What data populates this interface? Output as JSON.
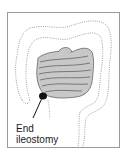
{
  "diagram": {
    "label_line1": "End",
    "label_line2": "ileostomy",
    "colors": {
      "frame": "#9a9a9a",
      "small_intestine_fill": "#c8c8c8",
      "outline": "#555555",
      "stoma": "#111111",
      "dotted_colon": "#8a8a8a"
    }
  }
}
